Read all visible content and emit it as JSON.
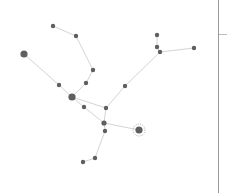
{
  "graph": {
    "colors": {
      "edge": "#d4d4d4",
      "node": "#5f5f5f",
      "highlight_ring": "#9a9a9a",
      "background": "#ffffff"
    },
    "highlighted_node": "L",
    "nodes": [
      {
        "id": "A",
        "x": 53,
        "y": 26,
        "r": 2.2
      },
      {
        "id": "B",
        "x": 76,
        "y": 36,
        "r": 2.2
      },
      {
        "id": "C",
        "x": 93,
        "y": 70,
        "r": 2.2
      },
      {
        "id": "D",
        "x": 86,
        "y": 83,
        "r": 2.2
      },
      {
        "id": "E",
        "x": 72,
        "y": 97,
        "r": 3.6
      },
      {
        "id": "F",
        "x": 59,
        "y": 85,
        "r": 2.2
      },
      {
        "id": "G",
        "x": 24,
        "y": 54,
        "r": 3.6
      },
      {
        "id": "H",
        "x": 84,
        "y": 107,
        "r": 2.2
      },
      {
        "id": "I",
        "x": 106,
        "y": 108,
        "r": 2.2
      },
      {
        "id": "J",
        "x": 104,
        "y": 123,
        "r": 2.6
      },
      {
        "id": "K",
        "x": 105,
        "y": 131,
        "r": 2.2
      },
      {
        "id": "L",
        "x": 139,
        "y": 130,
        "r": 3.6
      },
      {
        "id": "M",
        "x": 95,
        "y": 158,
        "r": 2.2
      },
      {
        "id": "N",
        "x": 83,
        "y": 162,
        "r": 2.2
      },
      {
        "id": "O",
        "x": 125,
        "y": 86,
        "r": 2.2
      },
      {
        "id": "P",
        "x": 160,
        "y": 52,
        "r": 2.2
      },
      {
        "id": "Q",
        "x": 157,
        "y": 47,
        "r": 2.2
      },
      {
        "id": "R",
        "x": 157,
        "y": 35,
        "r": 2.2
      },
      {
        "id": "S",
        "x": 194,
        "y": 48,
        "r": 2.2
      }
    ],
    "edges": [
      [
        "A",
        "B"
      ],
      [
        "B",
        "C"
      ],
      [
        "C",
        "D"
      ],
      [
        "D",
        "E"
      ],
      [
        "G",
        "F"
      ],
      [
        "F",
        "E"
      ],
      [
        "E",
        "H"
      ],
      [
        "H",
        "J"
      ],
      [
        "E",
        "I"
      ],
      [
        "I",
        "J"
      ],
      [
        "J",
        "K"
      ],
      [
        "J",
        "L"
      ],
      [
        "K",
        "M"
      ],
      [
        "M",
        "N"
      ],
      [
        "I",
        "O"
      ],
      [
        "O",
        "P"
      ],
      [
        "P",
        "Q"
      ],
      [
        "Q",
        "R"
      ],
      [
        "P",
        "S"
      ]
    ]
  },
  "side_panel": {
    "tick_y": 34
  }
}
